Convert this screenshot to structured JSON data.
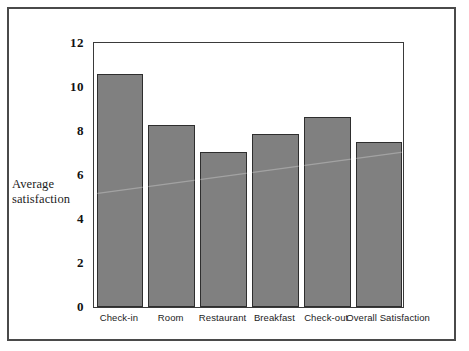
{
  "chart_data": {
    "type": "bar",
    "title": "",
    "subtitle": "",
    "xlabel": "",
    "ylabel": "Average satisfaction",
    "ylabel_lines": [
      "Average",
      "satisfaction"
    ],
    "categories": [
      "Check-in",
      "Room",
      "Restaurant",
      "Breakfast",
      "Check-out",
      "Overall Satisfaction"
    ],
    "values": [
      10.5,
      8.2,
      7.0,
      7.8,
      8.55,
      7.45
    ],
    "ylim": [
      0,
      12
    ],
    "yticks": [
      "12",
      "10",
      "8",
      "6",
      "4",
      "2",
      "0"
    ],
    "ytick_values": [
      12,
      10,
      8,
      6,
      4,
      2,
      0
    ],
    "grid": false,
    "legend": "none",
    "colors": {
      "bar_fill": "#808080",
      "bar_border": "#2e2e2e",
      "plot_border": "#3a3a3a",
      "outer_frame": "#4a4a4a",
      "text": "#1c1c1c",
      "background": "#ffffff"
    }
  }
}
